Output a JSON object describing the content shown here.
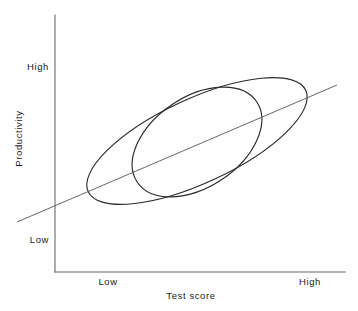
{
  "chart_data": {
    "type": "scatter",
    "title": "",
    "subtitle": "",
    "xlabel": "Test score",
    "ylabel": "Productivity",
    "x_tick_labels": [
      "Low",
      "High"
    ],
    "y_tick_labels": [
      "Low",
      "High"
    ],
    "xlim": [
      "Low",
      "High"
    ],
    "ylim": [
      "Low",
      "High"
    ],
    "grid": false,
    "legend": "none",
    "annotations": [],
    "series": [
      {
        "name": "outer-data-envelope",
        "type": "ellipse",
        "center_x": 197,
        "center_y": 141,
        "semi_major": 120,
        "semi_minor": 42,
        "rotation_deg": -25,
        "color": "#2b2b2b"
      },
      {
        "name": "inner-data-envelope",
        "type": "ellipse",
        "center_x": 197,
        "center_y": 142,
        "semi_major": 72,
        "semi_minor": 45,
        "rotation_deg": -34,
        "color": "#2b2b2b"
      },
      {
        "name": "regression-line",
        "type": "line",
        "x1": 17,
        "y1": 222,
        "x2": 337,
        "y2": 85,
        "color": "#555555"
      }
    ],
    "axes": {
      "y_axis_x": 55,
      "y_axis_top": 15,
      "y_axis_bottom": 272,
      "x_axis_y": 272,
      "x_axis_left": 55,
      "x_axis_right": 345,
      "color": "#6b6b6b"
    },
    "tick_positions": {
      "y_high": 67,
      "y_low": 240,
      "x_low": 108,
      "x_high": 310
    }
  },
  "labels": {
    "y_high": "High",
    "y_low": "Low",
    "x_low": "Low",
    "x_high": "High",
    "y_axis_title": "Productivity",
    "x_axis_title": "Test score"
  }
}
